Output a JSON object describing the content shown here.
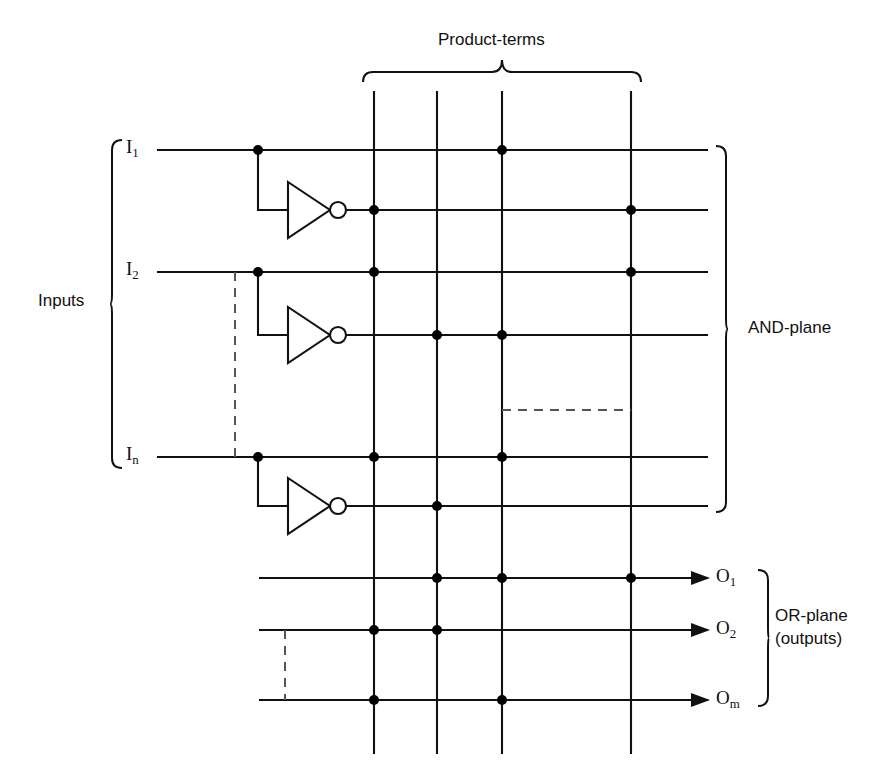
{
  "figure": {
    "kind": "pla-block-diagram",
    "title_top": "Product-terms",
    "label_inputs": "Inputs",
    "label_and_plane": "AND-plane",
    "label_or_plane_line1": "OR-plane",
    "label_or_plane_line2": "(outputs)",
    "colors": {
      "line": "#111111",
      "dot": "#000000",
      "dashed": "#555555",
      "background": "#ffffff"
    }
  },
  "inputs": [
    {
      "name": "I",
      "sub": "1"
    },
    {
      "name": "I",
      "sub": "2"
    },
    {
      "name": "I",
      "sub": "n"
    }
  ],
  "outputs": [
    {
      "name": "O",
      "sub": "1"
    },
    {
      "name": "O",
      "sub": "2"
    },
    {
      "name": "O",
      "sub": "m"
    }
  ],
  "product_term_columns": [
    {
      "index": 1,
      "x": 374
    },
    {
      "index": 2,
      "x": 437
    },
    {
      "index": 3,
      "x": 502
    },
    {
      "index": 4,
      "x": 631
    }
  ],
  "and_plane_rows": [
    {
      "id": "I1",
      "signal": "I1",
      "inverted": false,
      "y": 150,
      "connections": [
        3
      ]
    },
    {
      "id": "I1b",
      "signal": "I1",
      "inverted": true,
      "y": 210,
      "connections": [
        1,
        4
      ]
    },
    {
      "id": "I2",
      "signal": "I2",
      "inverted": false,
      "y": 272,
      "connections": [
        1,
        4
      ]
    },
    {
      "id": "I2b",
      "signal": "I2",
      "inverted": true,
      "y": 335,
      "connections": [
        2,
        3
      ]
    },
    {
      "id": "In",
      "signal": "In",
      "inverted": false,
      "y": 457,
      "connections": [
        1,
        3
      ]
    },
    {
      "id": "Inb",
      "signal": "In",
      "inverted": true,
      "y": 506,
      "connections": [
        2
      ]
    }
  ],
  "or_plane_rows": [
    {
      "id": "O1",
      "y": 578,
      "connections": [
        2,
        3,
        4
      ]
    },
    {
      "id": "O2",
      "y": 630,
      "connections": [
        1,
        2
      ]
    },
    {
      "id": "Om",
      "y": 700,
      "connections": [
        1,
        3
      ]
    }
  ],
  "ellipsis_marks": [
    {
      "orientation": "vertical",
      "x": 235,
      "y1": 272,
      "y2": 457,
      "meaning": "more-inputs"
    },
    {
      "orientation": "horizontal",
      "y": 410,
      "x1": 502,
      "x2": 631,
      "meaning": "more-product-terms"
    },
    {
      "orientation": "vertical",
      "x": 285,
      "y1": 630,
      "y2": 700,
      "meaning": "more-outputs"
    }
  ],
  "inverters": [
    {
      "for": "I1",
      "tap_x": 258,
      "in_y": 150,
      "out_y": 210
    },
    {
      "for": "I2",
      "tap_x": 258,
      "in_y": 272,
      "out_y": 335
    },
    {
      "for": "In",
      "tap_x": 258,
      "in_y": 457,
      "out_y": 506
    }
  ]
}
